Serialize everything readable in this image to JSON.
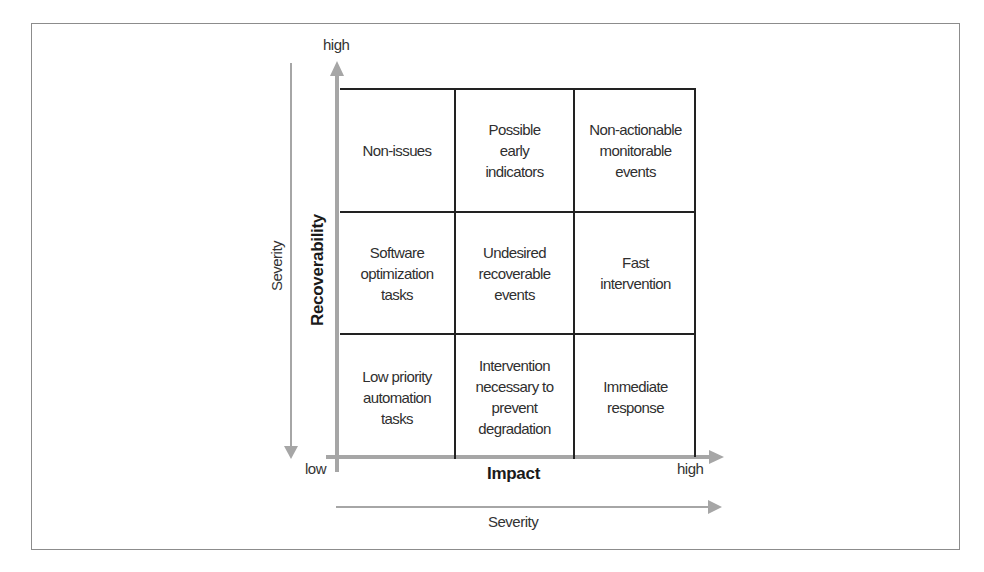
{
  "diagram": {
    "type": "3x3 matrix",
    "y_axis": {
      "label": "Recoverability",
      "high_label": "high"
    },
    "x_axis": {
      "label": "Impact",
      "low_label": "low",
      "high_label": "high"
    },
    "severity_vertical": {
      "label": "Severity",
      "direction": "down"
    },
    "severity_horizontal": {
      "label": "Severity",
      "direction": "right"
    },
    "cells": [
      [
        "Non-issues",
        "Possible\nearly\nindicators",
        "Non-actionable\nmonitorable\nevents"
      ],
      [
        "Software\noptimization\ntasks",
        "Undesired\nrecoverable\nevents",
        "Fast\nintervention"
      ],
      [
        "Low priority\nautomation\ntasks",
        "Intervention\nnecessary to\nprevent\ndegradation",
        "Immediate\nresponse"
      ]
    ],
    "colors": {
      "grid_line": "#222222",
      "axis_arrow": "#a6a6a6",
      "frame": "#8c8c8c",
      "text": "#2f2f2f"
    }
  }
}
